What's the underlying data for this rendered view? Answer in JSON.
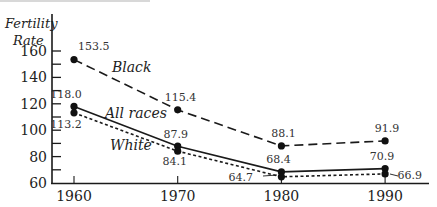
{
  "chart_data": {
    "type": "line",
    "title": "",
    "xlabel": "",
    "ylabel": "Fertility Rate",
    "ylabel_lines": [
      "Fertility",
      "Rate"
    ],
    "x": [
      1960,
      1970,
      1980,
      1990
    ],
    "x_tick_labels": [
      "1960",
      "1970",
      "1980",
      "1990"
    ],
    "y_tick_labels": [
      "60",
      "80",
      "100",
      "120",
      "140",
      "160"
    ],
    "ylim": [
      60,
      165
    ],
    "grid": false,
    "legend_position": "inline labels",
    "series": [
      {
        "name": "Black",
        "style": "long-dash",
        "values": [
          153.5,
          115.4,
          88.1,
          91.9
        ],
        "labels": [
          "153.5",
          "115.4",
          "88.1",
          "91.9"
        ]
      },
      {
        "name": "All races",
        "style": "solid",
        "values": [
          118.0,
          87.9,
          68.4,
          70.9
        ],
        "labels": [
          "118.0",
          "87.9",
          "68.4",
          "70.9"
        ]
      },
      {
        "name": "White",
        "style": "dotted",
        "values": [
          113.2,
          84.1,
          64.7,
          66.9
        ],
        "labels": [
          "113.2",
          "84.1",
          "64.7",
          "66.9"
        ]
      }
    ],
    "colors": {
      "line": "#1a1a1a",
      "text": "#222222"
    }
  }
}
